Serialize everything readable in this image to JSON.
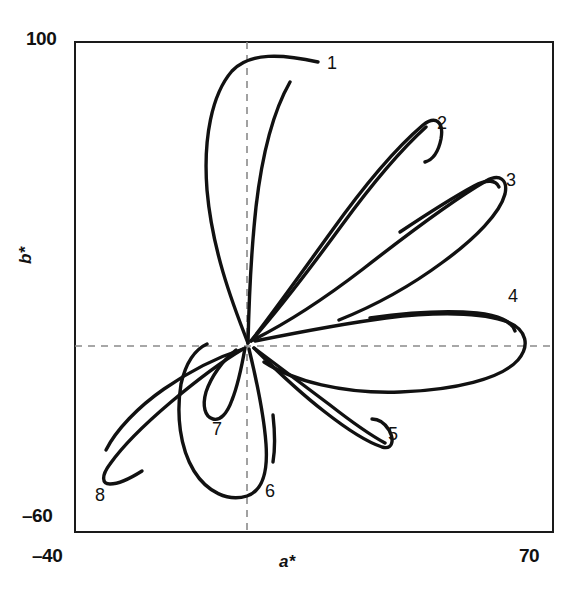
{
  "figure": {
    "background_color": "#ffffff",
    "frame_color": "#1a1a1a",
    "curve_color": "#111111",
    "grid_color": "#8a8a8a"
  },
  "axes": {
    "x": {
      "title": "a*",
      "min_label": "–40",
      "max_label": "70",
      "min": -40,
      "max": 70
    },
    "y": {
      "title": "b*",
      "min_label": "–60",
      "max_label": "100",
      "min": -60,
      "max": 100
    }
  },
  "chart_data": {
    "type": "line",
    "title": "",
    "subtitle": "",
    "xlabel": "a*",
    "ylabel": "b*",
    "xlim": [
      -40,
      70
    ],
    "ylim": [
      -60,
      100
    ],
    "xticks": [
      -40,
      0,
      70
    ],
    "yticks": [
      -60,
      0,
      100
    ],
    "xticklabels": [
      "–40",
      "",
      "70"
    ],
    "yticklabels": [
      "–60",
      "",
      "100"
    ],
    "grid": "dashed zero lines at a*=0 and b*=0",
    "legend": "none; curves annotated with numeric labels 1-8 at their tips",
    "origin": [
      0,
      0
    ],
    "series": [
      {
        "name": "1",
        "label": "1",
        "label_position": [
          12.5,
          89
        ],
        "tip": [
          9,
          94
        ],
        "petal_direction_deg": 86,
        "points": [
          [
            -1,
            1
          ],
          [
            -6,
            22
          ],
          [
            -9,
            45
          ],
          [
            -8,
            66
          ],
          [
            -4,
            82
          ],
          [
            2,
            91
          ],
          [
            9,
            94
          ],
          [
            17,
            93
          ]
        ],
        "inner_points": [
          [
            -1,
            1
          ],
          [
            0,
            20
          ],
          [
            1,
            42
          ],
          [
            3,
            62
          ],
          [
            5,
            80
          ],
          [
            7,
            90
          ]
        ]
      },
      {
        "name": "2",
        "label": "2",
        "label_position": [
          42,
          69
        ],
        "tip": [
          41,
          71
        ],
        "petal_direction_deg": 58,
        "points": [
          [
            0,
            1
          ],
          [
            7,
            17
          ],
          [
            15,
            33
          ],
          [
            24,
            49
          ],
          [
            33,
            62
          ],
          [
            41,
            70
          ],
          [
            45,
            71
          ],
          [
            47,
            66
          ],
          [
            45,
            60
          ]
        ],
        "inner_points": [
          [
            0,
            1
          ],
          [
            10,
            14
          ],
          [
            20,
            29
          ],
          [
            30,
            45
          ],
          [
            39,
            59
          ],
          [
            45,
            68
          ]
        ]
      },
      {
        "name": "3",
        "label": "3",
        "label_position": [
          56,
          54
        ],
        "tip": [
          55,
          51
        ],
        "petal_direction_deg": 40,
        "points": [
          [
            1,
            1
          ],
          [
            10,
            8
          ],
          [
            20,
            17
          ],
          [
            31,
            27
          ],
          [
            42,
            38
          ],
          [
            51,
            47
          ],
          [
            56,
            51
          ],
          [
            57,
            47
          ],
          [
            53,
            41
          ],
          [
            44,
            33
          ],
          [
            33,
            26
          ],
          [
            22,
            21
          ]
        ],
        "inner_points": [
          [
            1,
            1
          ],
          [
            12,
            6
          ],
          [
            24,
            13
          ],
          [
            36,
            22
          ],
          [
            47,
            32
          ],
          [
            55,
            41
          ]
        ]
      },
      {
        "name": "4",
        "label": "4",
        "label_position": [
          60,
          13
        ],
        "tip": [
          64,
          1
        ],
        "petal_direction_deg": 2,
        "points": [
          [
            2,
            1
          ],
          [
            14,
            4
          ],
          [
            27,
            7
          ],
          [
            40,
            9
          ],
          [
            52,
            10
          ],
          [
            61,
            9
          ],
          [
            65,
            4
          ],
          [
            64,
            -1
          ],
          [
            57,
            -5
          ],
          [
            45,
            -8
          ],
          [
            31,
            -9
          ],
          [
            17,
            -8
          ],
          [
            6,
            -4
          ]
        ],
        "inner_points": [
          [
            2,
            1
          ],
          [
            15,
            6
          ],
          [
            30,
            9
          ],
          [
            45,
            10
          ],
          [
            58,
            10
          ]
        ]
      },
      {
        "name": "5",
        "label": "5",
        "label_position": [
          34,
          -21
        ],
        "tip": [
          31,
          -22
        ],
        "petal_direction_deg": -36,
        "points": [
          [
            2,
            0
          ],
          [
            8,
            -6
          ],
          [
            14,
            -12
          ],
          [
            21,
            -18
          ],
          [
            27,
            -22
          ],
          [
            31,
            -23
          ],
          [
            33,
            -20
          ],
          [
            31,
            -16
          ],
          [
            27,
            -14
          ]
        ],
        "inner_points": [
          [
            2,
            0
          ],
          [
            9,
            -5
          ],
          [
            16,
            -10
          ],
          [
            24,
            -16
          ],
          [
            30,
            -20
          ]
        ]
      },
      {
        "name": "6",
        "label": "6",
        "label_position": [
          5,
          -45
        ],
        "tip": [
          -3,
          -51
        ],
        "petal_direction_deg": -94,
        "points": [
          [
            0,
            0
          ],
          [
            2,
            -12
          ],
          [
            4,
            -25
          ],
          [
            4,
            -38
          ],
          [
            1,
            -48
          ],
          [
            -5,
            -51
          ],
          [
            -11,
            -48
          ],
          [
            -14,
            -39
          ],
          [
            -14,
            -27
          ],
          [
            -11,
            -14
          ],
          [
            -6,
            -4
          ]
        ],
        "inner_points": [
          [
            2,
            -22
          ],
          [
            3,
            -32
          ],
          [
            3,
            -42
          ]
        ]
      },
      {
        "name": "7",
        "label": "7",
        "label_position": [
          -7,
          -27
        ],
        "tip": [
          -5,
          -24
        ],
        "petal_direction_deg": -104,
        "points": [
          [
            -1,
            0
          ],
          [
            -2,
            -8
          ],
          [
            -4,
            -16
          ],
          [
            -6,
            -22
          ],
          [
            -8,
            -24
          ],
          [
            -10,
            -21
          ],
          [
            -9,
            -14
          ],
          [
            -6,
            -6
          ],
          [
            -2,
            -1
          ]
        ],
        "inner_points": []
      },
      {
        "name": "8",
        "label": "8",
        "label_position": [
          -33,
          -45
        ],
        "tip": [
          -32,
          -41
        ],
        "petal_direction_deg": -150,
        "points": [
          [
            -2,
            -1
          ],
          [
            -10,
            -8
          ],
          [
            -18,
            -16
          ],
          [
            -25,
            -25
          ],
          [
            -30,
            -33
          ],
          [
            -33,
            -40
          ],
          [
            -31,
            -43
          ],
          [
            -27,
            -43
          ]
        ],
        "inner_points": [
          [
            -2,
            -1
          ],
          [
            -12,
            -6
          ],
          [
            -22,
            -14
          ],
          [
            -30,
            -24
          ],
          [
            -33,
            -33
          ]
        ]
      }
    ]
  },
  "curve_labels": [
    {
      "text": "1",
      "x": 327,
      "y": 53
    },
    {
      "text": "2",
      "x": 437,
      "y": 113
    },
    {
      "text": "3",
      "x": 506,
      "y": 170
    },
    {
      "text": "4",
      "x": 508,
      "y": 286
    },
    {
      "text": "5",
      "x": 388,
      "y": 424
    },
    {
      "text": "6",
      "x": 265,
      "y": 481
    },
    {
      "text": "7",
      "x": 212,
      "y": 419
    },
    {
      "text": "8",
      "x": 95,
      "y": 485
    }
  ]
}
